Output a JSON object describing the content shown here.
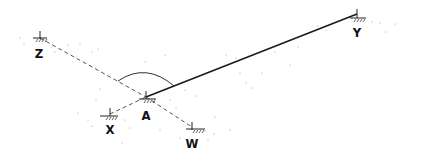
{
  "diagram": {
    "type": "surveying-sketch",
    "points": [
      {
        "id": "Z",
        "label": "Z",
        "x": 40,
        "y": 38,
        "lx": 39,
        "ly": 58
      },
      {
        "id": "Y",
        "label": "Y",
        "x": 357,
        "y": 14,
        "lx": 357,
        "ly": 37
      },
      {
        "id": "A",
        "label": "A",
        "x": 146,
        "y": 97,
        "lx": 146,
        "ly": 120
      },
      {
        "id": "X",
        "label": "X",
        "x": 110,
        "y": 114,
        "lx": 110,
        "ly": 134
      },
      {
        "id": "W",
        "label": "W",
        "x": 192,
        "y": 127,
        "lx": 192,
        "ly": 148
      }
    ],
    "lines": [
      {
        "from": "A",
        "to": "Y",
        "style": "solid"
      },
      {
        "from": "Z",
        "to": "A",
        "style": "dashed"
      },
      {
        "from": "A",
        "to": "W",
        "style": "dashed"
      },
      {
        "from": "X",
        "to": "A",
        "style": "dashed"
      }
    ],
    "angle_arc": {
      "vertex": "A",
      "between": [
        "Z",
        "Y"
      ]
    },
    "colors": {
      "line": "#1a1a1a",
      "dashed": "#555555",
      "speckle": "#9a9a9a"
    }
  }
}
